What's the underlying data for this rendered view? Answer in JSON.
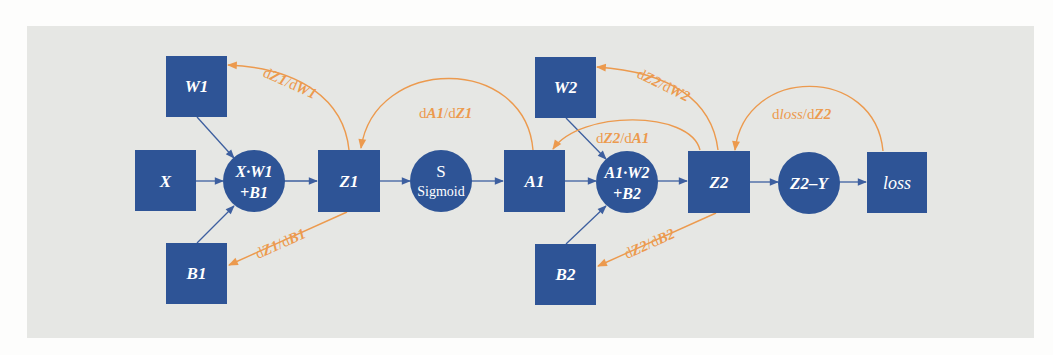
{
  "diagram": {
    "type": "computational-graph",
    "colors": {
      "node_fill": "#2e5496",
      "node_text": "#ffffff",
      "forward_edge": "#3d5f9f",
      "backward_edge": "#ec9a4e",
      "panel_background": "#e6e7e4"
    },
    "nodes": {
      "W1": {
        "label": "W1",
        "shape": "square"
      },
      "X": {
        "label": "X",
        "shape": "square"
      },
      "B1": {
        "label": "B1",
        "shape": "square"
      },
      "lin1": {
        "label_line1": "X·W1",
        "label_line2": "+B1",
        "shape": "circle"
      },
      "Z1": {
        "label": "Z1",
        "shape": "square"
      },
      "sigmoid": {
        "label_line1": "S",
        "label_line2": "Sigmoid",
        "shape": "circle"
      },
      "A1": {
        "label": "A1",
        "shape": "square"
      },
      "W2": {
        "label": "W2",
        "shape": "square"
      },
      "B2": {
        "label": "B2",
        "shape": "square"
      },
      "lin2": {
        "label_line1": "A1·W2",
        "label_line2": "+B2",
        "shape": "circle"
      },
      "Z2": {
        "label": "Z2",
        "shape": "square"
      },
      "diff": {
        "label": "Z2–Y",
        "shape": "circle"
      },
      "loss": {
        "label": "loss",
        "shape": "square"
      }
    },
    "forward_edges": [
      [
        "W1",
        "lin1"
      ],
      [
        "X",
        "lin1"
      ],
      [
        "B1",
        "lin1"
      ],
      [
        "lin1",
        "Z1"
      ],
      [
        "Z1",
        "sigmoid"
      ],
      [
        "sigmoid",
        "A1"
      ],
      [
        "A1",
        "lin2"
      ],
      [
        "W2",
        "lin2"
      ],
      [
        "B2",
        "lin2"
      ],
      [
        "lin2",
        "Z2"
      ],
      [
        "Z2",
        "diff"
      ],
      [
        "diff",
        "loss"
      ]
    ],
    "gradients": {
      "dZ1_dW1": {
        "d1": "d",
        "v1": "Z1",
        "sep": "/d",
        "v2": "W1",
        "from": "Z1",
        "to": "W1"
      },
      "dZ1_dB1": {
        "d1": "d",
        "v1": "Z1",
        "sep": "/d",
        "v2": "B1",
        "from": "Z1",
        "to": "B1"
      },
      "dA1_dZ1": {
        "d1": "d",
        "v1": "A1",
        "sep": "/d",
        "v2": "Z1",
        "from": "A1",
        "to": "Z1"
      },
      "dZ2_dW2": {
        "d1": "d",
        "v1": "Z2",
        "sep": "/d",
        "v2": "W2",
        "from": "Z2",
        "to": "W2"
      },
      "dZ2_dA1": {
        "d1": "d",
        "v1": "Z2",
        "sep": "/d",
        "v2": "A1",
        "from": "Z2",
        "to": "A1"
      },
      "dZ2_dB2": {
        "d1": "d",
        "v1": "Z2",
        "sep": "/d",
        "v2": "B2",
        "from": "Z2",
        "to": "B2"
      },
      "dloss_dZ2": {
        "d1": "d",
        "v1": "loss",
        "sep": "/d",
        "v2": "Z2",
        "from": "loss",
        "to": "Z2"
      }
    }
  }
}
